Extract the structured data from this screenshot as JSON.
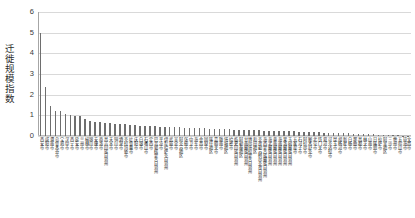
{
  "chart_data": {
    "type": "bar",
    "title": "",
    "xlabel": "",
    "ylabel": "迁徙规模指数",
    "ylim": [
      0,
      6
    ],
    "yticks": [
      0,
      1,
      2,
      3,
      4,
      5,
      6
    ],
    "grid": true,
    "legend": null,
    "bar_color": "#6e6e6e",
    "grid_color": "#d9d9d9",
    "axis_color": "#a6a6a6",
    "categories": [
      "西安市",
      "咸阳市",
      "渭南市",
      "乌鲁木齐市",
      "宝鸡市",
      "汉中市",
      "西宁市",
      "延安市",
      "兰州市",
      "榆林市",
      "银川市",
      "安康市",
      "商洛市",
      "昌吉回族自治州",
      "天水市",
      "铜川市",
      "酒泉市",
      "克拉玛依市",
      "吐鲁番市",
      "庆阳市",
      "白银市",
      "石嘴山市",
      "定西市",
      "巴音郭楞蒙古自治州",
      "平凉市",
      "伊犁哈萨克自治州",
      "武威市",
      "吴忠市",
      "阿克苏地区",
      "张掖市",
      "中卫市",
      "海东市",
      "金昌市",
      "固原市",
      "喀什地区",
      "嘉峪关市",
      "陇南市",
      "塔城地区",
      "哈密市",
      "临夏回族自治州",
      "阿勒泰地区",
      "甘南藏族自治州",
      "博尔塔拉蒙古自治州",
      "和田地区",
      "克孜勒苏柯尔克孜自治州",
      "海西蒙古族藏族自治州",
      "海北藏族自治州",
      "黄南藏族自治州",
      "海南藏族自治州",
      "果洛藏族自治州",
      "玉树藏族自治州",
      "五家渠市",
      "石河子市",
      "阿拉尔市",
      "图木舒克市",
      "北屯市",
      "铁门关市",
      "双河市",
      "可克达拉市",
      "昆玉市",
      "胡杨河市",
      "新星市",
      "白杨市",
      "那曲市",
      "昌都市",
      "林芝市",
      "山南市",
      "日喀则市",
      "拉萨市",
      "阿里地区",
      "三沙市",
      "儋州市",
      "五指山市",
      "琼海市",
      "文昌市"
    ],
    "values": [
      5.0,
      2.35,
      1.45,
      1.22,
      1.2,
      1.05,
      1.02,
      0.98,
      0.95,
      0.8,
      0.72,
      0.68,
      0.66,
      0.64,
      0.62,
      0.6,
      0.58,
      0.56,
      0.54,
      0.52,
      0.5,
      0.49,
      0.48,
      0.47,
      0.46,
      0.45,
      0.44,
      0.43,
      0.42,
      0.41,
      0.4,
      0.39,
      0.38,
      0.37,
      0.36,
      0.35,
      0.34,
      0.33,
      0.32,
      0.31,
      0.3,
      0.29,
      0.29,
      0.28,
      0.27,
      0.26,
      0.26,
      0.25,
      0.24,
      0.23,
      0.23,
      0.22,
      0.21,
      0.2,
      0.2,
      0.19,
      0.18,
      0.17,
      0.17,
      0.16,
      0.15,
      0.14,
      0.13,
      0.12,
      0.11,
      0.1,
      0.09,
      0.08,
      0.07,
      0.06,
      0.05,
      0.04,
      0.03,
      0.02,
      0.02
    ]
  }
}
